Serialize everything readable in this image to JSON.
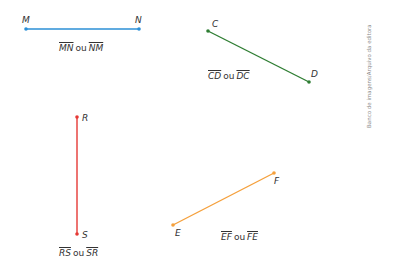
{
  "colors": {
    "mn": "#2b8fd6",
    "cd": "#2e7d32",
    "rs": "#e53935",
    "ef": "#f5a03c",
    "text": "#333333",
    "credit": "#8a8a8a"
  },
  "segments": [
    {
      "id": "mn",
      "points": [
        {
          "label": "M",
          "x": 26,
          "y": 29
        },
        {
          "label": "N",
          "x": 139,
          "y": 29
        }
      ],
      "caption": {
        "first": "MN",
        "connector": "ou",
        "second": "NM"
      }
    },
    {
      "id": "cd",
      "points": [
        {
          "label": "C",
          "x": 208,
          "y": 31
        },
        {
          "label": "D",
          "x": 309,
          "y": 82
        }
      ],
      "caption": {
        "first": "CD",
        "connector": "ou",
        "second": "DC"
      }
    },
    {
      "id": "rs",
      "points": [
        {
          "label": "R",
          "x": 77,
          "y": 117
        },
        {
          "label": "S",
          "x": 77,
          "y": 234
        }
      ],
      "caption": {
        "first": "RS",
        "connector": "ou",
        "second": "SR"
      }
    },
    {
      "id": "ef",
      "points": [
        {
          "label": "E",
          "x": 173,
          "y": 225
        },
        {
          "label": "F",
          "x": 274,
          "y": 173
        }
      ],
      "caption": {
        "first": "EF",
        "connector": "ou",
        "second": "FE"
      }
    }
  ],
  "credit": "Banco de imagens/Arquivo da editora"
}
